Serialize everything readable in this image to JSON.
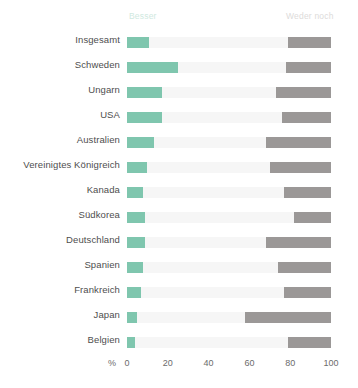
{
  "chart_data": {
    "type": "bar",
    "orientation": "horizontal",
    "stacked": true,
    "title": "",
    "xlabel": "%",
    "ylabel": "",
    "xlim": [
      0,
      100
    ],
    "xticks": [
      0,
      20,
      40,
      60,
      80,
      100
    ],
    "xtick_labels": [
      "0",
      "20",
      "40",
      "60",
      "80",
      "100"
    ],
    "grid": false,
    "legend_position": "top",
    "legend": [
      {
        "name": "Besser",
        "color": "#7fc6ae"
      },
      {
        "name": "Weder noch",
        "color": "#9b9897"
      }
    ],
    "series": [
      {
        "name": "Besser",
        "color": "#7fc6ae",
        "values": [
          11,
          25,
          17,
          17,
          13,
          10,
          8,
          9,
          9,
          8,
          7,
          5,
          4
        ]
      },
      {
        "name": "Mitte",
        "color": "#f6f6f6",
        "values": [
          68,
          53,
          56,
          59,
          55,
          60,
          69,
          73,
          59,
          66,
          70,
          53,
          75
        ]
      },
      {
        "name": "Weder noch",
        "color": "#9b9897",
        "values": [
          21,
          22,
          27,
          24,
          32,
          30,
          23,
          18,
          32,
          26,
          23,
          42,
          21
        ]
      }
    ],
    "categories": [
      "Insgesamt",
      "Schweden",
      "Ungarn",
      "USA",
      "Australien",
      "Vereinigtes Königreich",
      "Kanada",
      "Südkorea",
      "Deutschland",
      "Spanien",
      "Frankreich",
      "Japan",
      "Belgien"
    ]
  }
}
